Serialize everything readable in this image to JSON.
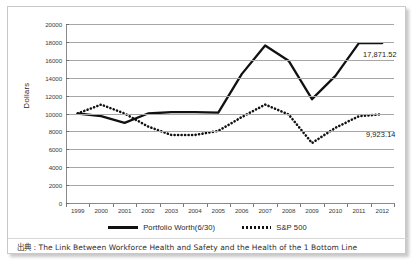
{
  "chart_data": {
    "type": "line",
    "title": "",
    "xlabel": "",
    "ylabel": "Dollars",
    "ylim": [
      0,
      20000
    ],
    "ytick_step": 2000,
    "grid": true,
    "legend_position": "bottom",
    "categories": [
      "1999",
      "2000",
      "2001",
      "2002",
      "2003",
      "2004",
      "2005",
      "2006",
      "2007",
      "2008",
      "2009",
      "2010",
      "2011",
      "2012"
    ],
    "yticks": [
      "20000",
      "18000",
      "16000",
      "14000",
      "12000",
      "10000",
      "8000",
      "6000",
      "4000",
      "2000",
      "0"
    ],
    "series": [
      {
        "name": "Portfolio Worth(6/30)",
        "style": "solid",
        "color": "#111111",
        "values": [
          10000,
          9700,
          8950,
          10000,
          10150,
          10150,
          10100,
          14400,
          17600,
          15900,
          11600,
          14200,
          17871.52,
          17871.52
        ],
        "end_label": "17,871.52"
      },
      {
        "name": "S&P 500",
        "style": "dotted",
        "color": "#111111",
        "values": [
          10000,
          11000,
          10000,
          8550,
          7600,
          7600,
          8050,
          9600,
          11000,
          9900,
          6700,
          8400,
          9700,
          9923.14
        ],
        "end_label": "9,923.14"
      }
    ],
    "annotations": [
      {
        "text": "17,871.52",
        "series": "Portfolio Worth(6/30)"
      },
      {
        "text": "9,923.14",
        "series": "S&P 500"
      }
    ]
  },
  "legend": {
    "items": [
      {
        "label": "Portfolio Worth(6/30)",
        "style": "solid"
      },
      {
        "label": "S&P 500",
        "style": "dotted"
      }
    ]
  },
  "footer": {
    "text": "出典 : The Link Between Workforce Health and Safety and the Health of the 1 Bottom Line"
  }
}
